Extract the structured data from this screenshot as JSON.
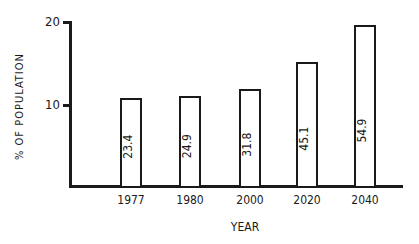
{
  "chart_data": {
    "type": "bar",
    "title": "",
    "xlabel": "YEAR",
    "ylabel": "% OF POPULATION",
    "categories": [
      "1977",
      "1980",
      "2000",
      "2020",
      "2040"
    ],
    "values": [
      10.7,
      11.0,
      11.8,
      15.1,
      19.6
    ],
    "bar_labels": [
      "23.4",
      "24.9",
      "31.8",
      "45.1",
      "54.9"
    ],
    "yticks": [
      "10",
      "20"
    ],
    "ylim": [
      0,
      20
    ],
    "grid": false,
    "legend": null
  }
}
